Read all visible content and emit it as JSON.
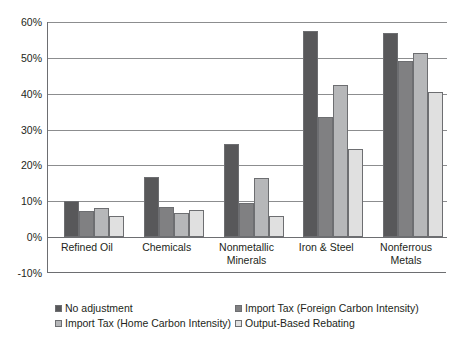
{
  "chart_data": {
    "type": "bar",
    "title": "",
    "subtitle": "",
    "xlabel": "",
    "ylabel": "",
    "grid": true,
    "legend_position": "bottom",
    "ylim": [
      -10,
      60
    ],
    "ytick_labels": [
      "60%",
      "50%",
      "40%",
      "30%",
      "20%",
      "10%",
      "0%",
      "-10%"
    ],
    "ytick_values": [
      60,
      50,
      40,
      30,
      20,
      10,
      0,
      -10
    ],
    "categories": [
      "Refined Oil",
      "Chemicals",
      "Nonmetallic\nMinerals",
      "Iron & Steel",
      "Nonferrous\nMetals"
    ],
    "series": [
      {
        "name": "No adjustment",
        "color": "#58585a",
        "values": [
          10.0,
          16.7,
          26.0,
          57.5,
          57.0
        ]
      },
      {
        "name": "Import Tax (Foreign Carbon Intensity)",
        "color": "#808082",
        "values": [
          7.3,
          8.5,
          9.5,
          33.5,
          49.0
        ]
      },
      {
        "name": "Import Tax (Home Carbon Intensity)",
        "color": "#b6b7b9",
        "values": [
          8.0,
          6.7,
          16.5,
          42.5,
          51.5
        ]
      },
      {
        "name": "Output-Based Rebating",
        "color": "#e0e0e0",
        "values": [
          6.0,
          7.5,
          6.0,
          24.5,
          40.5
        ]
      }
    ]
  }
}
